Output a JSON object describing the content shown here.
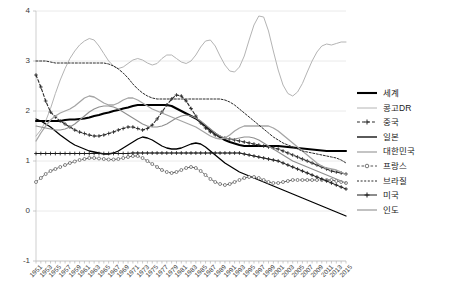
{
  "chart_data": {
    "type": "line",
    "title": "",
    "xlabel": "",
    "ylabel": "",
    "xlim": [
      1951,
      2015
    ],
    "ylim": [
      -1,
      4
    ],
    "ytick_values": [
      -1,
      0,
      1,
      2,
      3,
      4
    ],
    "ytick_labels": [
      "-1",
      "0",
      "1",
      "2",
      "3",
      "4"
    ],
    "grid": "horizontal",
    "legend_position": "right",
    "x": [
      1951,
      1952,
      1953,
      1954,
      1955,
      1956,
      1957,
      1958,
      1959,
      1960,
      1961,
      1962,
      1963,
      1964,
      1965,
      1966,
      1967,
      1968,
      1969,
      1970,
      1971,
      1972,
      1973,
      1974,
      1975,
      1976,
      1977,
      1978,
      1979,
      1980,
      1981,
      1982,
      1983,
      1984,
      1985,
      1986,
      1987,
      1988,
      1989,
      1990,
      1991,
      1992,
      1993,
      1994,
      1995,
      1996,
      1997,
      1998,
      1999,
      2000,
      2001,
      2002,
      2003,
      2004,
      2005,
      2006,
      2007,
      2008,
      2009,
      2010,
      2011,
      2012,
      2013,
      2014,
      2015
    ],
    "xtick_labels": [
      "1951",
      "1953",
      "1955",
      "1957",
      "1959",
      "1961",
      "1963",
      "1965",
      "1967",
      "1969",
      "1971",
      "1973",
      "1975",
      "1977",
      "1979",
      "1981",
      "1983",
      "1985",
      "1987",
      "1989",
      "1991",
      "1993",
      "1995",
      "1997",
      "1999",
      "2001",
      "2003",
      "2005",
      "2007",
      "2009",
      "2011",
      "2013",
      "2015"
    ],
    "series": [
      {
        "name": "세계",
        "color": "#000000",
        "style": "solid",
        "width": 2.1,
        "marker": "none",
        "values": [
          1.8,
          1.8,
          1.8,
          1.8,
          1.8,
          1.8,
          1.82,
          1.83,
          1.83,
          1.84,
          1.85,
          1.87,
          1.9,
          1.92,
          1.95,
          1.97,
          2.0,
          2.02,
          2.05,
          2.07,
          2.1,
          2.12,
          2.12,
          2.12,
          2.12,
          2.12,
          2.12,
          2.12,
          2.1,
          2.05,
          2.0,
          1.95,
          1.9,
          1.85,
          1.78,
          1.7,
          1.62,
          1.55,
          1.48,
          1.42,
          1.38,
          1.35,
          1.32,
          1.3,
          1.3,
          1.3,
          1.3,
          1.3,
          1.3,
          1.3,
          1.3,
          1.29,
          1.28,
          1.27,
          1.26,
          1.25,
          1.24,
          1.23,
          1.22,
          1.21,
          1.2,
          1.2,
          1.2,
          1.2,
          1.2
        ]
      },
      {
        "name": "콩고DR",
        "color": "#b4b4b4",
        "style": "solid",
        "width": 1.0,
        "marker": "none",
        "values": [
          1.5,
          1.62,
          1.8,
          2.05,
          2.35,
          2.62,
          2.85,
          3.05,
          3.2,
          3.32,
          3.4,
          3.45,
          3.42,
          3.3,
          3.15,
          3.0,
          2.9,
          2.85,
          2.88,
          2.95,
          3.02,
          3.05,
          3.02,
          2.96,
          2.92,
          2.95,
          3.05,
          3.12,
          3.12,
          3.05,
          2.98,
          2.95,
          3.0,
          3.12,
          3.28,
          3.4,
          3.42,
          3.3,
          3.1,
          2.92,
          2.8,
          2.78,
          2.88,
          3.1,
          3.42,
          3.72,
          3.9,
          3.88,
          3.6,
          3.2,
          2.82,
          2.52,
          2.35,
          2.3,
          2.38,
          2.55,
          2.78,
          3.0,
          3.18,
          3.3,
          3.34,
          3.32,
          3.35,
          3.38,
          3.38
        ]
      },
      {
        "name": "중국",
        "color": "#2a2a2a",
        "style": "dashed",
        "width": 1.1,
        "marker": "plus",
        "values": [
          2.72,
          2.48,
          2.2,
          1.98,
          1.88,
          1.8,
          1.74,
          1.68,
          1.62,
          1.58,
          1.55,
          1.52,
          1.5,
          1.5,
          1.52,
          1.55,
          1.58,
          1.62,
          1.65,
          1.68,
          1.68,
          1.65,
          1.62,
          1.65,
          1.72,
          1.84,
          1.98,
          2.12,
          2.24,
          2.32,
          2.3,
          2.2,
          2.05,
          1.9,
          1.76,
          1.66,
          1.58,
          1.52,
          1.48,
          1.46,
          1.44,
          1.42,
          1.4,
          1.38,
          1.36,
          1.34,
          1.32,
          1.3,
          1.28,
          1.26,
          1.24,
          1.2,
          1.16,
          1.12,
          1.08,
          1.04,
          1.0,
          0.96,
          0.92,
          0.88,
          0.84,
          0.8,
          0.78,
          0.76,
          0.74
        ]
      },
      {
        "name": "일본",
        "color": "#000000",
        "style": "solid",
        "width": 1.3,
        "marker": "none",
        "values": [
          1.84,
          1.8,
          1.74,
          1.68,
          1.6,
          1.52,
          1.45,
          1.38,
          1.32,
          1.28,
          1.24,
          1.2,
          1.18,
          1.16,
          1.14,
          1.14,
          1.16,
          1.2,
          1.26,
          1.32,
          1.38,
          1.44,
          1.48,
          1.46,
          1.42,
          1.36,
          1.3,
          1.26,
          1.24,
          1.24,
          1.26,
          1.3,
          1.34,
          1.36,
          1.34,
          1.28,
          1.2,
          1.12,
          1.04,
          0.96,
          0.9,
          0.84,
          0.78,
          0.74,
          0.7,
          0.66,
          0.62,
          0.58,
          0.54,
          0.5,
          0.46,
          0.42,
          0.38,
          0.34,
          0.3,
          0.26,
          0.22,
          0.18,
          0.14,
          0.1,
          0.06,
          0.02,
          -0.02,
          -0.06,
          -0.1
        ]
      },
      {
        "name": "대한민국",
        "color": "#a5a5a5",
        "style": "solid",
        "width": 1.3,
        "marker": "none",
        "values": [
          1.4,
          1.56,
          1.7,
          1.82,
          1.9,
          1.96,
          2.0,
          2.04,
          2.1,
          2.18,
          2.26,
          2.3,
          2.28,
          2.22,
          2.16,
          2.12,
          2.12,
          2.16,
          2.22,
          2.26,
          2.26,
          2.22,
          2.16,
          2.1,
          2.04,
          2.0,
          1.96,
          1.92,
          1.88,
          1.84,
          1.8,
          1.76,
          1.72,
          1.68,
          1.62,
          1.56,
          1.5,
          1.46,
          1.44,
          1.46,
          1.52,
          1.6,
          1.66,
          1.7,
          1.7,
          1.7,
          1.7,
          1.7,
          1.7,
          1.66,
          1.6,
          1.52,
          1.44,
          1.36,
          1.28,
          1.2,
          1.12,
          1.04,
          0.96,
          0.9,
          0.86,
          0.84,
          0.82,
          0.78,
          0.72
        ]
      },
      {
        "name": "프랑스",
        "color": "#555555",
        "style": "dashed",
        "width": 0.9,
        "marker": "circle",
        "values": [
          0.58,
          0.66,
          0.74,
          0.8,
          0.84,
          0.88,
          0.92,
          0.96,
          0.99,
          1.02,
          1.04,
          1.06,
          1.06,
          1.05,
          1.04,
          1.03,
          1.03,
          1.04,
          1.06,
          1.08,
          1.1,
          1.1,
          1.06,
          1.0,
          0.94,
          0.88,
          0.82,
          0.78,
          0.76,
          0.78,
          0.82,
          0.86,
          0.88,
          0.86,
          0.8,
          0.72,
          0.64,
          0.58,
          0.54,
          0.52,
          0.54,
          0.58,
          0.62,
          0.66,
          0.68,
          0.68,
          0.66,
          0.62,
          0.58,
          0.56,
          0.56,
          0.58,
          0.6,
          0.62,
          0.62,
          0.62,
          0.62,
          0.62,
          0.62,
          0.62,
          0.62,
          0.62,
          0.6,
          0.58,
          0.56
        ]
      },
      {
        "name": "브라질",
        "color": "#2a2a2a",
        "style": "dotted",
        "width": 1.0,
        "marker": "none",
        "values": [
          3.0,
          3.0,
          3.0,
          2.98,
          2.96,
          2.96,
          2.96,
          2.96,
          2.96,
          2.96,
          2.96,
          2.96,
          2.96,
          2.96,
          2.96,
          2.94,
          2.9,
          2.84,
          2.76,
          2.66,
          2.54,
          2.44,
          2.36,
          2.3,
          2.26,
          2.24,
          2.24,
          2.24,
          2.24,
          2.24,
          2.24,
          2.24,
          2.24,
          2.24,
          2.24,
          2.24,
          2.24,
          2.24,
          2.24,
          2.22,
          2.18,
          2.12,
          2.04,
          1.96,
          1.88,
          1.8,
          1.72,
          1.64,
          1.56,
          1.48,
          1.42,
          1.36,
          1.32,
          1.28,
          1.24,
          1.2,
          1.18,
          1.16,
          1.14,
          1.12,
          1.1,
          1.08,
          1.06,
          1.02,
          0.96
        ]
      },
      {
        "name": "미국",
        "color": "#1a1a1a",
        "style": "solid",
        "width": 1.0,
        "marker": "plus",
        "values": [
          1.15,
          1.15,
          1.15,
          1.15,
          1.15,
          1.15,
          1.15,
          1.15,
          1.15,
          1.15,
          1.15,
          1.15,
          1.15,
          1.15,
          1.15,
          1.15,
          1.15,
          1.15,
          1.15,
          1.15,
          1.16,
          1.16,
          1.16,
          1.16,
          1.16,
          1.16,
          1.16,
          1.16,
          1.16,
          1.16,
          1.16,
          1.16,
          1.16,
          1.16,
          1.16,
          1.16,
          1.16,
          1.16,
          1.16,
          1.16,
          1.16,
          1.16,
          1.16,
          1.14,
          1.12,
          1.1,
          1.08,
          1.06,
          1.04,
          1.02,
          1.0,
          0.96,
          0.92,
          0.88,
          0.84,
          0.8,
          0.76,
          0.72,
          0.68,
          0.64,
          0.6,
          0.56,
          0.52,
          0.48,
          0.44
        ]
      },
      {
        "name": "인도",
        "color": "#8f8f8f",
        "style": "solid",
        "width": 1.1,
        "marker": "none",
        "values": [
          1.7,
          1.68,
          1.66,
          1.64,
          1.62,
          1.62,
          1.64,
          1.68,
          1.74,
          1.82,
          1.9,
          1.98,
          2.04,
          2.08,
          2.1,
          2.1,
          2.08,
          2.04,
          1.98,
          1.92,
          1.86,
          1.8,
          1.74,
          1.7,
          1.68,
          1.68,
          1.7,
          1.74,
          1.8,
          1.86,
          1.9,
          1.92,
          1.9,
          1.86,
          1.8,
          1.72,
          1.64,
          1.56,
          1.5,
          1.46,
          1.44,
          1.44,
          1.46,
          1.48,
          1.48,
          1.46,
          1.42,
          1.36,
          1.3,
          1.24,
          1.18,
          1.12,
          1.06,
          1.0,
          0.96,
          0.92,
          0.88,
          0.84,
          0.8,
          0.76,
          0.72,
          0.68,
          0.64,
          0.6,
          0.56
        ]
      }
    ]
  },
  "legend": {
    "items": [
      {
        "label": "세계"
      },
      {
        "label": "콩고DR"
      },
      {
        "label": "중국"
      },
      {
        "label": "일본"
      },
      {
        "label": "대한민국"
      },
      {
        "label": "프랑스"
      },
      {
        "label": "브라질"
      },
      {
        "label": "미국"
      },
      {
        "label": "인도"
      }
    ]
  }
}
